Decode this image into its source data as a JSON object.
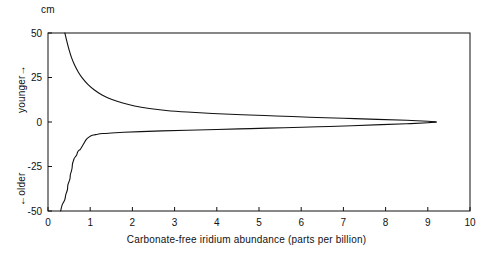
{
  "chart_data": {
    "type": "line",
    "title": "",
    "xlabel": "Carbonate-free iridium abundance (parts per billion)",
    "ylabel": "cm",
    "y_unit": "cm",
    "y_direction_labels": {
      "upper": "younger→",
      "lower": "←older"
    },
    "xlim": [
      0,
      10
    ],
    "ylim": [
      -50,
      50
    ],
    "xticks": [
      "0",
      "1",
      "2",
      "3",
      "4",
      "5",
      "6",
      "7",
      "8",
      "9",
      "10"
    ],
    "yticks": [
      "50",
      "25",
      "0",
      "-25",
      "-50"
    ],
    "grid": false,
    "legend": null,
    "frame": "box",
    "series": [
      {
        "name": "upper-envelope",
        "description": "Upper bounding curve, decays from 50 cm at low iridium abundance toward 0 cm at high abundance",
        "points": [
          [
            0.4,
            50.0
          ],
          [
            0.45,
            45.0
          ],
          [
            0.5,
            40.5
          ],
          [
            0.56,
            36.0
          ],
          [
            0.63,
            32.0
          ],
          [
            0.72,
            28.0
          ],
          [
            0.82,
            24.5
          ],
          [
            0.95,
            21.0
          ],
          [
            1.1,
            18.0
          ],
          [
            1.28,
            15.2
          ],
          [
            1.5,
            12.8
          ],
          [
            1.75,
            10.8
          ],
          [
            2.05,
            9.0
          ],
          [
            2.4,
            7.6
          ],
          [
            2.8,
            6.5
          ],
          [
            3.3,
            5.6
          ],
          [
            3.9,
            4.8
          ],
          [
            4.6,
            4.1
          ],
          [
            5.4,
            3.4
          ],
          [
            6.2,
            2.7
          ],
          [
            7.0,
            2.1
          ],
          [
            7.8,
            1.5
          ],
          [
            8.5,
            1.0
          ],
          [
            9.0,
            0.4
          ],
          [
            9.2,
            0.0
          ]
        ]
      },
      {
        "name": "lower-envelope",
        "description": "Lower bounding curve with stepped wiggles, rises from -50 cm near 0.3 ppb toward 0 cm at high abundance",
        "points": [
          [
            0.3,
            -50.0
          ],
          [
            0.33,
            -47.0
          ],
          [
            0.37,
            -45.0
          ],
          [
            0.4,
            -43.5
          ],
          [
            0.42,
            -41.0
          ],
          [
            0.44,
            -39.5
          ],
          [
            0.46,
            -38.0
          ],
          [
            0.47,
            -35.5
          ],
          [
            0.49,
            -34.0
          ],
          [
            0.52,
            -32.0
          ],
          [
            0.53,
            -29.5
          ],
          [
            0.55,
            -28.0
          ],
          [
            0.57,
            -26.0
          ],
          [
            0.58,
            -23.5
          ],
          [
            0.6,
            -22.0
          ],
          [
            0.62,
            -20.5
          ],
          [
            0.65,
            -19.5
          ],
          [
            0.68,
            -18.5
          ],
          [
            0.7,
            -17.0
          ],
          [
            0.73,
            -16.0
          ],
          [
            0.76,
            -15.5
          ],
          [
            0.8,
            -14.0
          ],
          [
            0.85,
            -12.0
          ],
          [
            0.9,
            -10.0
          ],
          [
            0.97,
            -8.5
          ],
          [
            1.05,
            -7.5
          ],
          [
            1.15,
            -7.0
          ],
          [
            1.3,
            -6.5
          ],
          [
            1.5,
            -6.2
          ],
          [
            1.8,
            -5.8
          ],
          [
            2.2,
            -5.4
          ],
          [
            2.7,
            -5.0
          ],
          [
            3.3,
            -4.6
          ],
          [
            4.0,
            -4.2
          ],
          [
            4.8,
            -3.7
          ],
          [
            5.6,
            -3.2
          ],
          [
            6.4,
            -2.7
          ],
          [
            7.2,
            -2.1
          ],
          [
            7.9,
            -1.5
          ],
          [
            8.5,
            -1.0
          ],
          [
            9.0,
            -0.4
          ],
          [
            9.2,
            0.0
          ]
        ]
      }
    ]
  },
  "axis": {
    "x_title": "Carbonate-free iridium abundance (parts per billion)",
    "y_unit": "cm",
    "younger_label": "younger→",
    "older_label": "←older"
  },
  "xticks": [
    {
      "label": "0"
    },
    {
      "label": "1"
    },
    {
      "label": "2"
    },
    {
      "label": "3"
    },
    {
      "label": "4"
    },
    {
      "label": "5"
    },
    {
      "label": "6"
    },
    {
      "label": "7"
    },
    {
      "label": "8"
    },
    {
      "label": "9"
    },
    {
      "label": "10"
    }
  ],
  "yticks": [
    {
      "label": "50"
    },
    {
      "label": "25"
    },
    {
      "label": "0"
    },
    {
      "label": "-25"
    },
    {
      "label": "-50"
    }
  ],
  "colors": {
    "ink": "#111111",
    "background": "#ffffff"
  }
}
